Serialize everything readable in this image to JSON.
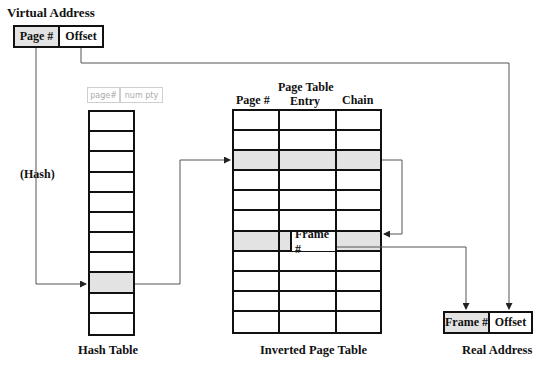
{
  "virtual_address": {
    "title": "Virtual Address",
    "fields": [
      "Page #",
      "Offset"
    ]
  },
  "hash_label": "(Hash)",
  "hash_table": {
    "title": "Hash Table",
    "rows": 11,
    "highlighted_row": 8,
    "handwritten_header": [
      "page#",
      "num pty"
    ]
  },
  "inverted_page_table": {
    "title": "Inverted Page Table",
    "columns": [
      "Page #",
      "Page Table\nEntry",
      "Chain"
    ],
    "column_1": "Page #",
    "column_2_line1": "Page Table",
    "column_2_line2": "Entry",
    "column_3": "Chain",
    "rows": 11,
    "highlighted_rows": [
      2,
      6
    ],
    "frame_cell_label": "Frame #"
  },
  "real_address": {
    "title": "Real Address",
    "fields": [
      "Frame #",
      "Offset"
    ]
  }
}
